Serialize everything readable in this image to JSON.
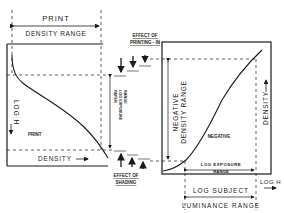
{
  "diagram": {
    "left_panel": {
      "top_label_line1": "PRINT",
      "top_label_line2": "DENSITY RANGE",
      "y_axis_label": "LOG H",
      "x_axis_label": "DENSITY",
      "curve_label": "PRINT",
      "range_label_line1": "PAPER",
      "range_label_line2": "LOG EXPOSURE",
      "range_label_line3": "RANGE"
    },
    "middle": {
      "top_effect_line1": "EFFECT OF",
      "top_effect_line2": "PRINTING - IN",
      "bottom_effect_line1": "EFFECT OF",
      "bottom_effect_line2": "SHADING"
    },
    "right_panel": {
      "left_range_line1": "NEGATIVE",
      "left_range_line2": "DENSITY RANGE",
      "y_axis_label": "DENSITY",
      "x_axis_label": "LOG H",
      "curve_label": "NEGATIVE",
      "exposure_label_line1": "LOG EXPOSURE",
      "exposure_label_line2": "RANGE",
      "bottom_label_line1": "LOG SUBJECT",
      "bottom_label_line2": "LUMINANCE RANGE"
    },
    "colors": {
      "ink": "#1a1a1a",
      "background": "#ffffff"
    }
  }
}
